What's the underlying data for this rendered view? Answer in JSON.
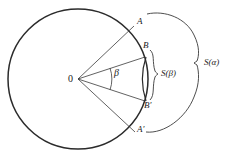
{
  "figure": {
    "type": "geometric-diagram",
    "stroke_color": "#2b2b2b",
    "background_color": "#ffffff",
    "width": 243,
    "height": 161
  },
  "circle": {
    "center_label": "0",
    "center_x": 78,
    "center_y": 79,
    "radius": 70
  },
  "points": [
    {
      "label": "A",
      "x": 137,
      "y": 23,
      "angle_deg": 37
    },
    {
      "label": "B",
      "x": 145,
      "y": 46,
      "angle_deg": 18
    },
    {
      "label": "B'",
      "x": 146,
      "y": 104,
      "angle_deg": -18
    },
    {
      "label": "A'",
      "x": 138,
      "y": 131,
      "angle_deg": -37
    }
  ],
  "angle_marker": {
    "label": "β",
    "label_x": 117,
    "label_y": 72,
    "arc_radius": 34
  },
  "braces": [
    {
      "name": "inner-brace",
      "label": "S(β)",
      "label_x": 161,
      "label_y": 74,
      "spans": [
        "B",
        "B'"
      ]
    },
    {
      "name": "outer-brace",
      "label": "S(α)",
      "label_x": 204,
      "label_y": 63,
      "spans": [
        "A",
        "A'"
      ]
    }
  ],
  "labels": {
    "center": "0",
    "point_a": "A",
    "point_b": "B",
    "point_b_prime": "B'",
    "point_a_prime": "A'",
    "angle_beta": "β",
    "s_beta": "S(β)",
    "s_alpha": "S(α)"
  }
}
